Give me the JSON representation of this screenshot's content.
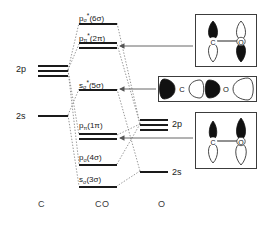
{
  "diagram": {
    "axis_labels": [
      {
        "name": "left-atom",
        "text": "C",
        "x": 38,
        "y": 199
      },
      {
        "name": "molecule",
        "text": "CO",
        "x": 95,
        "y": 199
      },
      {
        "name": "right-atom",
        "text": "O",
        "x": 158,
        "y": 199
      }
    ],
    "atomic_levels_left": [
      {
        "name": "c-2p",
        "label": "2p",
        "label_x": 16,
        "label_y": 64,
        "lines": [
          {
            "x": 38,
            "y": 65,
            "w": 30
          },
          {
            "x": 38,
            "y": 70,
            "w": 30
          },
          {
            "x": 38,
            "y": 75,
            "w": 30
          }
        ]
      },
      {
        "name": "c-2s",
        "label": "2s",
        "label_x": 16,
        "label_y": 111,
        "lines": [
          {
            "x": 38,
            "y": 115,
            "w": 30
          }
        ]
      }
    ],
    "atomic_levels_right": [
      {
        "name": "o-2p",
        "label": "2p",
        "label_x": 172,
        "label_y": 119,
        "lines": [
          {
            "x": 140,
            "y": 119,
            "w": 28
          },
          {
            "x": 140,
            "y": 124,
            "w": 28
          },
          {
            "x": 140,
            "y": 129,
            "w": 28
          }
        ]
      },
      {
        "name": "o-2s",
        "label": "2s",
        "label_x": 172,
        "label_y": 167,
        "lines": [
          {
            "x": 140,
            "y": 171,
            "w": 28
          }
        ]
      }
    ],
    "molecular_orbitals": [
      {
        "name": "mo-6sigma-star",
        "label_html": "p<sub>&#963;</sub><sup>*</sup>(6&#963;)",
        "label_text": "pσ*(6σ)",
        "label_x": 79,
        "label_y": 11,
        "lines": [
          {
            "x": 79,
            "y": 23,
            "w": 38
          }
        ]
      },
      {
        "name": "mo-2pi-star",
        "label_html": "p<sub>&#960;</sub><sup>*</sup>(2&#960;)",
        "label_text": "pπ*(2π)",
        "label_x": 79,
        "label_y": 31,
        "lines": [
          {
            "x": 79,
            "y": 42,
            "w": 38
          },
          {
            "x": 79,
            "y": 47,
            "w": 38
          }
        ]
      },
      {
        "name": "mo-5sigma-star",
        "label_html": "s<sub>&#963;</sub><sup>*</sup>(5&#963;)",
        "label_text": "sσ*(5σ)",
        "label_x": 79,
        "label_y": 78,
        "lines": [
          {
            "x": 79,
            "y": 89,
            "w": 38
          }
        ]
      },
      {
        "name": "mo-1pi",
        "label_html": "p<sub>&#960;</sub>(1&#960;)",
        "label_text": "pπ(1π)",
        "label_x": 79,
        "label_y": 121,
        "lines": [
          {
            "x": 79,
            "y": 133,
            "w": 38
          },
          {
            "x": 79,
            "y": 138,
            "w": 38
          }
        ]
      },
      {
        "name": "mo-4sigma",
        "label_html": "p<sub>&#963;</sub>(4&#963;)",
        "label_text": "pσ(4σ)",
        "label_x": 79,
        "label_y": 153,
        "lines": [
          {
            "x": 79,
            "y": 164,
            "w": 38
          }
        ]
      },
      {
        "name": "mo-3sigma",
        "label_html": "s<sub>&#963;</sub>(3&#963;)",
        "label_text": "sσ(3σ)",
        "label_x": 79,
        "label_y": 175,
        "lines": [
          {
            "x": 79,
            "y": 186,
            "w": 38
          }
        ]
      }
    ],
    "orbital_pictures": [
      {
        "name": "orbital-box-pi-antibonding",
        "description": "pi antibonding orbital: carbon p lobe filled up, oxygen p lobe filled down",
        "x": 195,
        "y": 14,
        "w": 62,
        "h": 53,
        "atom_left": "C",
        "atom_right": "O",
        "points_to": "mo-2pi-star",
        "arrow": {
          "x1": 193,
          "y1": 46,
          "x2": 120,
          "y2": 46
        }
      },
      {
        "name": "orbital-box-sigma-antibonding",
        "description": "sigma antibonding orbital with alternating filled and open lobes along C-O axis",
        "x": 158,
        "y": 76,
        "w": 99,
        "h": 26,
        "atom_left": "C",
        "atom_right": "O",
        "points_to": "mo-5sigma-star",
        "arrow": {
          "x1": 156,
          "y1": 89,
          "x2": 120,
          "y2": 89
        }
      },
      {
        "name": "orbital-box-pi-bonding",
        "description": "pi bonding orbital: both carbon and oxygen p lobes filled up",
        "x": 195,
        "y": 112,
        "w": 62,
        "h": 57,
        "atom_left": "C",
        "atom_right": "O",
        "points_to": "mo-1pi",
        "arrow": {
          "x1": 193,
          "y1": 138,
          "x2": 120,
          "y2": 138
        }
      }
    ],
    "correlation_lines": [
      {
        "from": "c-2p",
        "to": "mo-6sigma-star",
        "x1": 68,
        "y1": 70,
        "x2": 79,
        "y2": 23
      },
      {
        "from": "c-2p",
        "to": "mo-2pi-star",
        "x1": 68,
        "y1": 70,
        "x2": 79,
        "y2": 44
      },
      {
        "from": "c-2p",
        "to": "mo-1pi",
        "x1": 68,
        "y1": 70,
        "x2": 79,
        "y2": 135
      },
      {
        "from": "c-2p",
        "to": "mo-4sigma",
        "x1": 68,
        "y1": 70,
        "x2": 79,
        "y2": 164
      },
      {
        "from": "c-2s",
        "to": "mo-5sigma-star",
        "x1": 68,
        "y1": 115,
        "x2": 79,
        "y2": 89
      },
      {
        "from": "c-2s",
        "to": "mo-3sigma",
        "x1": 68,
        "y1": 115,
        "x2": 79,
        "y2": 186
      },
      {
        "from": "o-2p",
        "to": "mo-6sigma-star",
        "x1": 140,
        "y1": 124,
        "x2": 117,
        "y2": 23
      },
      {
        "from": "o-2p",
        "to": "mo-2pi-star",
        "x1": 140,
        "y1": 124,
        "x2": 117,
        "y2": 44
      },
      {
        "from": "o-2p",
        "to": "mo-1pi",
        "x1": 140,
        "y1": 124,
        "x2": 117,
        "y2": 135
      },
      {
        "from": "o-2p",
        "to": "mo-4sigma",
        "x1": 140,
        "y1": 124,
        "x2": 117,
        "y2": 164
      },
      {
        "from": "o-2s",
        "to": "mo-5sigma-star",
        "x1": 140,
        "y1": 171,
        "x2": 117,
        "y2": 89
      },
      {
        "from": "o-2s",
        "to": "mo-3sigma",
        "x1": 140,
        "y1": 171,
        "x2": 117,
        "y2": 186
      }
    ],
    "colors": {
      "line": "#1a1a1a",
      "dotted": "#8a8a8a",
      "box_border": "#3c3c3c",
      "lobe_filled": "#111111",
      "lobe_open": "#ffffff",
      "background": "#ffffff"
    }
  }
}
